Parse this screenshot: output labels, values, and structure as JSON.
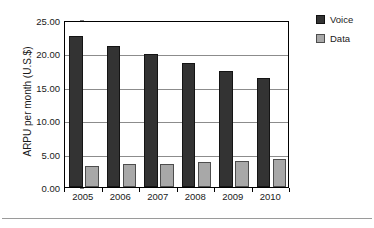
{
  "chart_data": {
    "type": "bar",
    "title": "",
    "subtitle": "",
    "xlabel": "",
    "ylabel": "ARPU per month (U.S.$)",
    "categories": [
      "2005",
      "2006",
      "2007",
      "2008",
      "2009",
      "2010"
    ],
    "series": [
      {
        "name": "Voice",
        "color": "#333333",
        "values": [
          22.6,
          21.1,
          19.9,
          18.6,
          17.4,
          16.3
        ]
      },
      {
        "name": "Data",
        "color": "#a8a8a8",
        "values": [
          3.1,
          3.4,
          3.5,
          3.7,
          3.9,
          4.2
        ]
      }
    ],
    "ylim": [
      0,
      25
    ],
    "ytick_values": [
      0,
      5,
      10,
      15,
      20,
      25
    ],
    "ytick_labels": [
      "0.00",
      "5.00",
      "10.00",
      "15.00",
      "20.00",
      "25.00"
    ],
    "grid": true,
    "grid_axis": "y",
    "legend_position": "right",
    "legend_entries": [
      "Voice",
      "Data"
    ]
  },
  "colors": {
    "voice": "#333333",
    "data": "#a8a8a8",
    "gridline": "#8c8c8c",
    "axis": "#000000",
    "text": "#1a1a1a",
    "background": "#ffffff"
  }
}
